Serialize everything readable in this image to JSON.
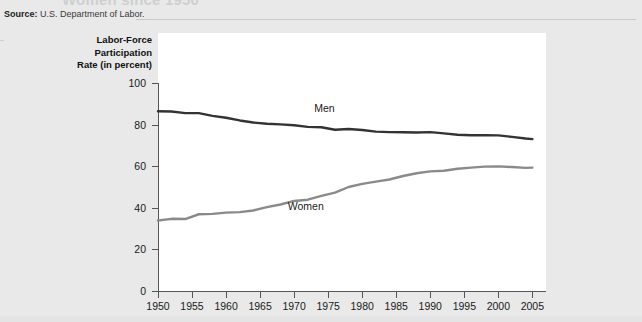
{
  "page": {
    "title_partial": "Women since 1950",
    "source_label": "Source:",
    "source_text": "U.S. Department of Labor."
  },
  "chart_data": {
    "type": "line",
    "title": "",
    "xlabel": "",
    "ylabel": "Labor-Force Participation Rate (in percent)",
    "ylabel_lines": [
      "Labor-Force",
      "Participation",
      "Rate (in percent)"
    ],
    "xlim": [
      1950,
      2007
    ],
    "ylim": [
      0,
      100
    ],
    "grid": false,
    "legend": "inline-annotations",
    "ytick_labels": [
      "0",
      "20",
      "40",
      "60",
      "80",
      "100"
    ],
    "yticks": [
      0,
      20,
      40,
      60,
      80,
      100
    ],
    "xtick_labels": [
      "1950",
      "1955",
      "1960",
      "1965",
      "1970",
      "1975",
      "1980",
      "1985",
      "1990",
      "1995",
      "2000",
      "2005"
    ],
    "xticks": [
      1950,
      1955,
      1960,
      1965,
      1970,
      1975,
      1980,
      1985,
      1990,
      1995,
      2000,
      2005
    ],
    "x": [
      1950,
      1952,
      1954,
      1956,
      1958,
      1960,
      1962,
      1964,
      1966,
      1968,
      1970,
      1972,
      1974,
      1976,
      1978,
      1980,
      1982,
      1984,
      1986,
      1988,
      1990,
      1992,
      1994,
      1996,
      1998,
      2000,
      2002,
      2004,
      2005
    ],
    "series": [
      {
        "name": "Men",
        "color": "#333333",
        "label_x": 1975,
        "label_y": 88,
        "values": [
          86.4,
          86.3,
          85.5,
          85.5,
          84.2,
          83.3,
          82.0,
          81.0,
          80.4,
          80.1,
          79.7,
          78.9,
          78.7,
          77.5,
          77.9,
          77.4,
          76.6,
          76.4,
          76.3,
          76.2,
          76.4,
          75.8,
          75.1,
          74.9,
          74.9,
          74.8,
          74.1,
          73.3,
          73.0
        ]
      },
      {
        "name": "Women",
        "color": "#8a8a8a",
        "label_x": 1972,
        "label_y": 41,
        "values": [
          33.9,
          34.7,
          34.6,
          36.9,
          37.1,
          37.7,
          37.9,
          38.7,
          40.3,
          41.6,
          43.3,
          43.9,
          45.7,
          47.3,
          50.0,
          51.5,
          52.6,
          53.6,
          55.3,
          56.6,
          57.5,
          57.8,
          58.8,
          59.3,
          59.8,
          59.9,
          59.6,
          59.2,
          59.3
        ]
      }
    ]
  }
}
